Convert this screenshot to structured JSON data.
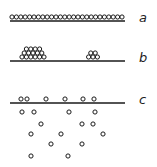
{
  "panels": [
    {
      "label": "a",
      "description": "single monolayer row of particles on surface",
      "surface": {
        "x1": 10,
        "x2": 125,
        "y": 21
      },
      "label_pos": {
        "x": 139,
        "y": 22
      },
      "particle_rows": [
        {
          "y": 17,
          "x_start": 12,
          "count": 26,
          "step": 4.4
        }
      ]
    },
    {
      "label": "b",
      "description": "particles aggregated into stacked islands on surface",
      "surface": {
        "x1": 10,
        "x2": 125,
        "y": 61
      },
      "label_pos": {
        "x": 139,
        "y": 62
      },
      "particle_rows": [
        {
          "y": 57,
          "x_start": 22,
          "count": 6,
          "step": 4.4
        },
        {
          "y": 53,
          "x_start": 24.2,
          "count": 5,
          "step": 4.4
        },
        {
          "y": 49,
          "x_start": 26.4,
          "count": 4,
          "step": 4.4
        },
        {
          "y": 57,
          "x_start": 88.6,
          "count": 3,
          "step": 4.4
        },
        {
          "y": 53,
          "x_start": 90.8,
          "count": 2,
          "step": 4.4
        }
      ]
    },
    {
      "label": "c",
      "description": "particles dispersed below and on surface",
      "surface": {
        "x1": 10,
        "x2": 125,
        "y": 103
      },
      "label_pos": {
        "x": 139,
        "y": 104
      },
      "particles": [
        [
          21,
          99
        ],
        [
          27,
          99
        ],
        [
          46,
          99
        ],
        [
          65,
          99
        ],
        [
          83,
          99
        ],
        [
          94,
          99
        ],
        [
          22,
          112
        ],
        [
          34,
          112
        ],
        [
          69,
          112
        ],
        [
          95,
          112
        ],
        [
          41,
          124
        ],
        [
          82,
          124
        ],
        [
          93,
          124
        ],
        [
          31,
          134
        ],
        [
          61,
          134
        ],
        [
          103,
          134
        ],
        [
          51,
          144
        ],
        [
          82,
          144
        ],
        [
          31,
          156
        ],
        [
          68,
          156
        ]
      ]
    }
  ],
  "style": {
    "particle_radius": 2.1,
    "stroke": "#1a1a1a",
    "surface_stroke": "#1a1a1a"
  }
}
